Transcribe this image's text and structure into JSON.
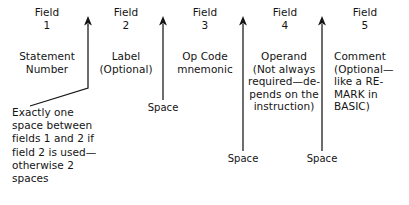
{
  "diagram": {
    "ink_color": "#151515",
    "background_color": "#ffffff"
  },
  "fields": [
    {
      "head_word": "Field",
      "head_number": "1",
      "description": "Statement\nNumber"
    },
    {
      "head_word": "Field",
      "head_number": "2",
      "description": "Label\n(Optional)"
    },
    {
      "head_word": "Field",
      "head_number": "3",
      "description": "Op Code\nmnemonic"
    },
    {
      "head_word": "Field",
      "head_number": "4",
      "description": "Operand\n(Not always\nrequired—de-\npends on the\ninstruction)"
    },
    {
      "head_word": "Field",
      "head_number": "5",
      "description": "Comment\n(Optional—\nlike a RE-\nMARK in\nBASIC)"
    }
  ],
  "separators": [
    {
      "id": "separator-1",
      "label": "",
      "note": "Exactly one space between fields 1 and 2 if field 2 is used—otherwise 2 spaces",
      "kind": "bent-arrow"
    },
    {
      "id": "separator-2",
      "label": "Space",
      "kind": "straight-arrow"
    },
    {
      "id": "separator-3",
      "label": "Space",
      "kind": "straight-arrow"
    },
    {
      "id": "separator-4",
      "label": "Space",
      "kind": "straight-arrow"
    }
  ],
  "notes": {
    "spacing_note": "Exactly one\nspace between\nfields 1 and 2 if\nfield 2 is used—\notherwise 2\nspaces"
  }
}
